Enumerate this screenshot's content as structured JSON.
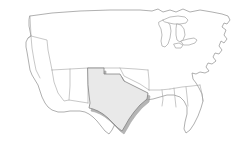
{
  "figure": {
    "title": "United States map with Texas highlighted",
    "type": "choropleth-outline-map",
    "width": 245,
    "height": 156,
    "background_color": "#ffffff",
    "projection_note": "simplified contiguous United States outline"
  },
  "style": {
    "outline_stroke": "#8e8e8e",
    "state_border_stroke": "#a2a2a2",
    "lake_stroke": "#9a9a9a",
    "land_fill": "#ffffff",
    "highlight_fill": "#e9e9e9",
    "highlight_stroke": "#7d7d7d",
    "shadow_fill": "#9d9d9d"
  },
  "map": {
    "region_name": "Contiguous United States",
    "highlighted_region": {
      "name": "Texas",
      "fill": "#e9e9e9",
      "has_drop_shadow": true,
      "shadow_offset_x": 2,
      "shadow_offset_y": 3
    },
    "features": [
      {
        "name": "national-outline",
        "label": "Contiguous United States coastline and borders"
      },
      {
        "name": "great-lakes",
        "label": "Great Lakes"
      },
      {
        "name": "state-borders",
        "label": "Interior state boundaries"
      },
      {
        "name": "texas-highlight",
        "label": "Texas"
      }
    ],
    "labels": []
  }
}
